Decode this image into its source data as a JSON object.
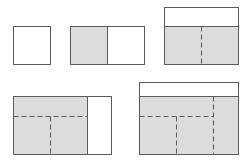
{
  "diagram": {
    "colors": {
      "stroke": "#5a5a5a",
      "shaded": "#dcdcdc",
      "blank": "#ffffff",
      "dash": "#5a5a5a"
    },
    "panels": [
      {
        "id": "single-box",
        "label": ""
      },
      {
        "id": "two-column",
        "label": ""
      },
      {
        "id": "header-two-column",
        "label": ""
      },
      {
        "id": "grid-with-sidebar",
        "label": ""
      },
      {
        "id": "header-grid-with-sidebar",
        "label": ""
      }
    ]
  }
}
